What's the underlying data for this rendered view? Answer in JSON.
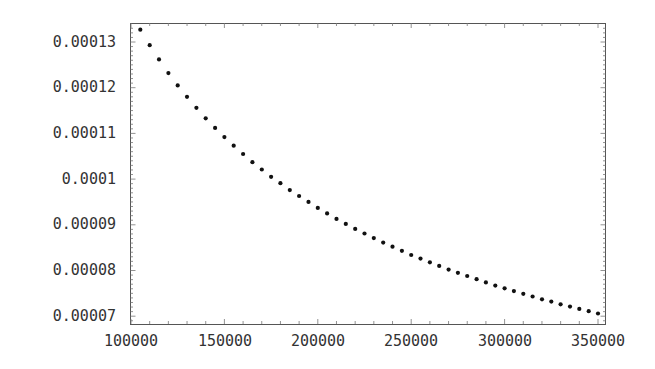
{
  "chart_data": {
    "type": "scatter",
    "title": "",
    "xlabel": "",
    "ylabel": "",
    "xlim": [
      100000,
      355000
    ],
    "ylim": [
      6.86e-05,
      0.0001342
    ],
    "grid": false,
    "legend": null,
    "x_ticks": [
      100000,
      150000,
      200000,
      250000,
      300000,
      350000
    ],
    "x_tick_labels": [
      "100000",
      "150000",
      "200000",
      "250000",
      "300000",
      "350000"
    ],
    "y_ticks": [
      7e-05,
      8e-05,
      9e-05,
      0.0001,
      0.00011,
      0.00012,
      0.00013
    ],
    "y_tick_labels": [
      "0.00007",
      "0.00008",
      "0.00009",
      "0.0001",
      "0.00011",
      "0.00012",
      "0.00013"
    ],
    "series": [
      {
        "name": "points",
        "color": "#111111",
        "x": [
          105000,
          110000,
          115000,
          120000,
          125000,
          130000,
          135000,
          140000,
          145000,
          150000,
          155000,
          160000,
          165000,
          170000,
          175000,
          180000,
          185000,
          190000,
          195000,
          200000,
          205000,
          210000,
          215000,
          220000,
          225000,
          230000,
          235000,
          240000,
          245000,
          250000,
          255000,
          260000,
          265000,
          270000,
          275000,
          280000,
          285000,
          290000,
          295000,
          300000,
          305000,
          310000,
          315000,
          320000,
          325000,
          330000,
          335000,
          340000,
          345000,
          350000
        ],
        "y": [
          0.0001327,
          0.0001293,
          0.0001262,
          0.0001232,
          0.0001205,
          0.000118,
          0.0001156,
          0.0001133,
          0.0001112,
          0.0001092,
          0.0001073,
          0.0001055,
          0.0001037,
          0.0001021,
          0.0001005,
          9.91e-05,
          9.76e-05,
          9.63e-05,
          9.5e-05,
          9.37e-05,
          9.25e-05,
          9.13e-05,
          9.02e-05,
          8.91e-05,
          8.81e-05,
          8.71e-05,
          8.61e-05,
          8.52e-05,
          8.43e-05,
          8.34e-05,
          8.26e-05,
          8.18e-05,
          8.1e-05,
          8.02e-05,
          7.95e-05,
          7.88e-05,
          7.81e-05,
          7.74e-05,
          7.67e-05,
          7.61e-05,
          7.55e-05,
          7.49e-05,
          7.43e-05,
          7.37e-05,
          7.32e-05,
          7.26e-05,
          7.21e-05,
          7.16e-05,
          7.11e-05,
          7.06e-05
        ]
      }
    ]
  },
  "axes": {
    "x_labels": [
      "100000",
      "150000",
      "200000",
      "250000",
      "300000",
      "350000"
    ],
    "y_labels": [
      "0.00007",
      "0.00008",
      "0.00009",
      "0.0001",
      "0.00011",
      "0.00012",
      "0.00013"
    ]
  },
  "style": {
    "frame_color": "#555555",
    "point_color": "#111111",
    "text_color": "#333333"
  }
}
